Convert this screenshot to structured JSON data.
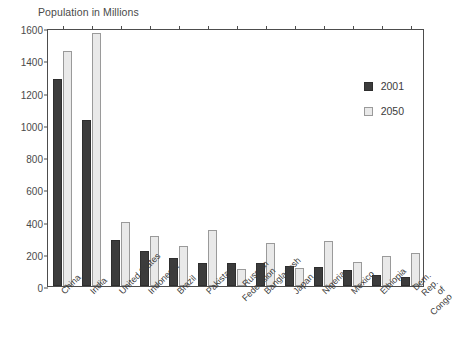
{
  "chart_data": {
    "type": "bar",
    "title": "Population in Millions",
    "xlabel": "",
    "ylabel": "Population in Millions",
    "ylim": [
      0,
      1600
    ],
    "ytick_step": 200,
    "yticks": [
      0,
      200,
      400,
      600,
      800,
      1000,
      1200,
      1400,
      1600
    ],
    "grid": false,
    "legend_position": "right-upper",
    "source_note": "Source: UNPD",
    "categories": [
      "China",
      "India",
      "United States",
      "Indonesia",
      "Brazil",
      "Pakistan",
      "Russian Federation",
      "Bangladesh",
      "Japan",
      "Nigeria",
      "Mexico",
      "Ethiopia",
      "Dem. Rep. of Congo"
    ],
    "series": [
      {
        "name": "2001",
        "color": "#3c3c3c",
        "values": [
          1285,
          1030,
          285,
          215,
          172,
          145,
          145,
          140,
          127,
          117,
          100,
          67,
          53
        ]
      },
      {
        "name": "2050",
        "color": "#e9e9e9",
        "values": [
          1460,
          1570,
          400,
          310,
          247,
          345,
          104,
          265,
          110,
          280,
          147,
          188,
          203
        ]
      }
    ]
  },
  "labels": {
    "axis_title": "Population in Millions",
    "source": "Source: UNPD"
  }
}
